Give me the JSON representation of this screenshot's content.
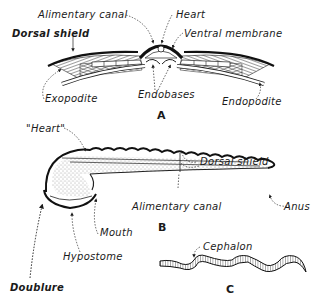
{
  "figure": {
    "panels": [
      {
        "id": "A",
        "label": "A",
        "description": "Cross-section of trilobite body",
        "annotations": {
          "alimentary_canal": "Alimentary canal",
          "heart": "Heart",
          "dorsal_shield": "Dorsal shield",
          "ventral_membrane": "Ventral membrane",
          "exopodite": "Exopodite",
          "endobases": "Endobases",
          "endopodite": "Endopodite"
        }
      },
      {
        "id": "B",
        "label": "B",
        "description": "Longitudinal section of trilobite",
        "annotations": {
          "heart": "\"Heart\"",
          "dorsal_shield": "Dorsal shield",
          "alimentary_canal": "Alimentary canal",
          "anus": "Anus",
          "mouth": "Mouth",
          "hypostome": "Hypostome",
          "doublure": "Doublure"
        }
      },
      {
        "id": "C",
        "label": "C",
        "description": "Enrolled / wavy cephalon profile",
        "annotations": {
          "cephalon": "Cephalon"
        }
      }
    ],
    "colors": {
      "ink": "#1a1a1a",
      "background": "#ffffff",
      "stipple": "#8a8a8a"
    }
  }
}
